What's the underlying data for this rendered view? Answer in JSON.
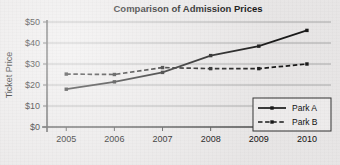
{
  "chart_data": {
    "type": "line",
    "title": "Comparison of Admission Prices",
    "xlabel": "",
    "ylabel": "Ticket Price",
    "categories": [
      "2005",
      "2006",
      "2007",
      "2008",
      "2009",
      "2010"
    ],
    "x": [
      2005,
      2006,
      2007,
      2008,
      2009,
      2010
    ],
    "xlim": [
      2004.6,
      2010.5
    ],
    "ylim": [
      0,
      50
    ],
    "ytick_labels": [
      "$0",
      "$10",
      "$20",
      "$30",
      "$40",
      "$50"
    ],
    "ytick_values": [
      0,
      10,
      20,
      30,
      40,
      50
    ],
    "grid": "horizontal",
    "legend_position": "bottom-right",
    "series": [
      {
        "name": "Park A",
        "style": "solid",
        "marker": "square",
        "color": "#1a1a1a",
        "values": [
          18,
          21.5,
          26,
          34,
          38.5,
          46
        ]
      },
      {
        "name": "Park B",
        "style": "dashed",
        "marker": "square",
        "color": "#1a1a1a",
        "values": [
          25.2,
          25,
          28.3,
          27.8,
          27.8,
          30
        ]
      }
    ]
  },
  "colors": {
    "background": "#eceaea",
    "axis": "#555555",
    "grid": "#999999",
    "ink": "#1a1a1a"
  }
}
